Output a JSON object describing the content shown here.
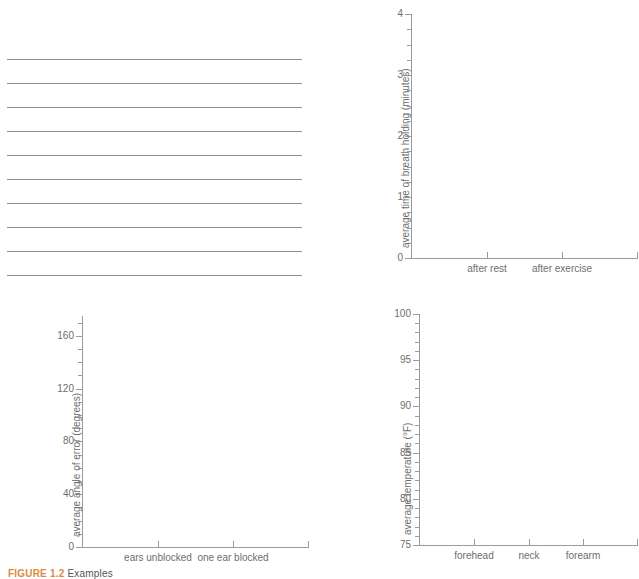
{
  "page": {
    "background_color": "#ffffff",
    "axis_color": "#9b9b9b",
    "text_color": "#6e6e6e",
    "rule_color": "#8f8f8f",
    "caption_accent_color": "#e08a3c"
  },
  "ruled_lines": {
    "name": "blank-ruled-writing-area",
    "count": 10,
    "y_positions": [
      59,
      83,
      107,
      131,
      155,
      179,
      203,
      227,
      251,
      275
    ]
  },
  "charts": [
    {
      "id": "breath-holding",
      "title": "",
      "chart_data": {
        "type": "bar",
        "title": "",
        "xlabel": "",
        "ylabel": "average time of breath holding (minutes)",
        "categories": [
          "after rest",
          "after exercise"
        ],
        "values": [],
        "series": [],
        "ylim": [
          0,
          4
        ],
        "ytick_labels": [
          "0",
          "1",
          "2",
          "3",
          "4"
        ],
        "ytick_values": [
          0,
          1,
          2,
          3,
          4
        ],
        "y_minor_step": 0.25,
        "grid": false,
        "legend": false,
        "note": "empty axes - no data plotted"
      }
    },
    {
      "id": "angle-of-error",
      "title": "",
      "chart_data": {
        "type": "bar",
        "title": "",
        "xlabel": "",
        "ylabel": "average angle of error (degrees)",
        "categories": [
          "ears unblocked",
          "one ear blocked"
        ],
        "values": [],
        "series": [],
        "ylim": [
          0,
          175
        ],
        "ytick_labels": [
          "0",
          "40",
          "80",
          "120",
          "160"
        ],
        "ytick_values": [
          0,
          40,
          80,
          120,
          160
        ],
        "y_minor_step": 10,
        "grid": false,
        "legend": false,
        "note": "empty axes - no data plotted"
      }
    },
    {
      "id": "skin-temperature",
      "title": "",
      "chart_data": {
        "type": "bar",
        "title": "",
        "xlabel": "",
        "ylabel": "average temperature (°F)",
        "categories": [
          "forehead",
          "neck",
          "forearm"
        ],
        "values": [],
        "series": [],
        "ylim": [
          75,
          100
        ],
        "ytick_labels": [
          "75",
          "80",
          "85",
          "90",
          "95",
          "100"
        ],
        "ytick_values": [
          75,
          80,
          85,
          90,
          95,
          100
        ],
        "y_minor_step": 1,
        "grid": false,
        "legend": false,
        "note": "empty axes - no data plotted"
      }
    }
  ],
  "caption": {
    "figure_label": "FIGURE 1.2",
    "figure_text": "Examples"
  }
}
